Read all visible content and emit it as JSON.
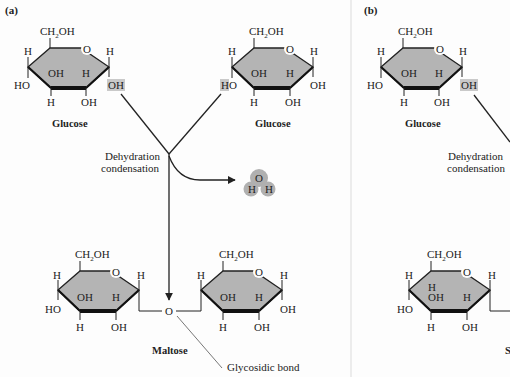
{
  "panel_a": {
    "tag": "(a)",
    "glucose_left": {
      "top_group": "CH2OH",
      "ring_o": "O",
      "h_left": "H",
      "h_right": "H",
      "oh_inner": "OH",
      "h_inner": "H",
      "ho_left": "HO",
      "oh_right_highlight": "OH",
      "h_bottom": "H",
      "oh_bottom": "OH",
      "name": "Glucose"
    },
    "glucose_right": {
      "top_group": "CH2OH",
      "ring_o": "O",
      "h_left": "H",
      "h_right": "H",
      "oh_inner": "OH",
      "h_inner": "H",
      "ho_left_highlight_h": "H",
      "ho_left_o": "O",
      "oh_right": "OH",
      "h_bottom": "H",
      "oh_bottom": "OH",
      "name": "Glucose"
    },
    "reaction": {
      "line1": "Dehydration",
      "line2": "condensation"
    },
    "water": {
      "o": "O",
      "h1": "H",
      "h2": "H"
    },
    "maltose": {
      "left_ring": {
        "top_group": "CH2OH",
        "ring_o": "O",
        "h_left": "H",
        "h_right": "H",
        "oh_inner": "OH",
        "h_inner": "H",
        "ho_left": "HO",
        "h_bottom": "H",
        "oh_bottom": "OH"
      },
      "bridge_o": "O",
      "right_ring": {
        "top_group": "CH2OH",
        "ring_o": "O",
        "h_left": "H",
        "h_right": "H",
        "oh_inner": "OH",
        "h_inner": "H",
        "oh_right": "OH",
        "h_bottom": "H",
        "oh_bottom": "OH"
      },
      "name": "Maltose",
      "bond_label": "Glycosidic bond"
    }
  },
  "panel_b": {
    "tag": "(b)",
    "glucose": {
      "top_group": "CH2OH",
      "ring_o": "O",
      "h_left": "H",
      "h_right": "H",
      "oh_inner": "OH",
      "h_inner": "H",
      "ho_left": "HO",
      "oh_right_highlight": "OH",
      "h_bottom": "H",
      "oh_bottom": "OH",
      "name": "Glucose"
    },
    "reaction": {
      "line1": "Dehydration",
      "line2": "condensation"
    },
    "product_ring": {
      "top_group": "CH2OH",
      "ring_o": "O",
      "h_left": "H",
      "h_right": "H",
      "h_inner_top": "H",
      "oh_inner": "OH",
      "h_inner": "H",
      "ho_left": "HO",
      "h_bottom": "H",
      "oh_bottom": "OH"
    },
    "product_name_partial": "S"
  },
  "colors": {
    "ring_fill": "#b4b4b4",
    "highlight": "#c9c9c9",
    "water": "#b0b0b0",
    "line": "#222222",
    "background": "#fdfdfd"
  }
}
